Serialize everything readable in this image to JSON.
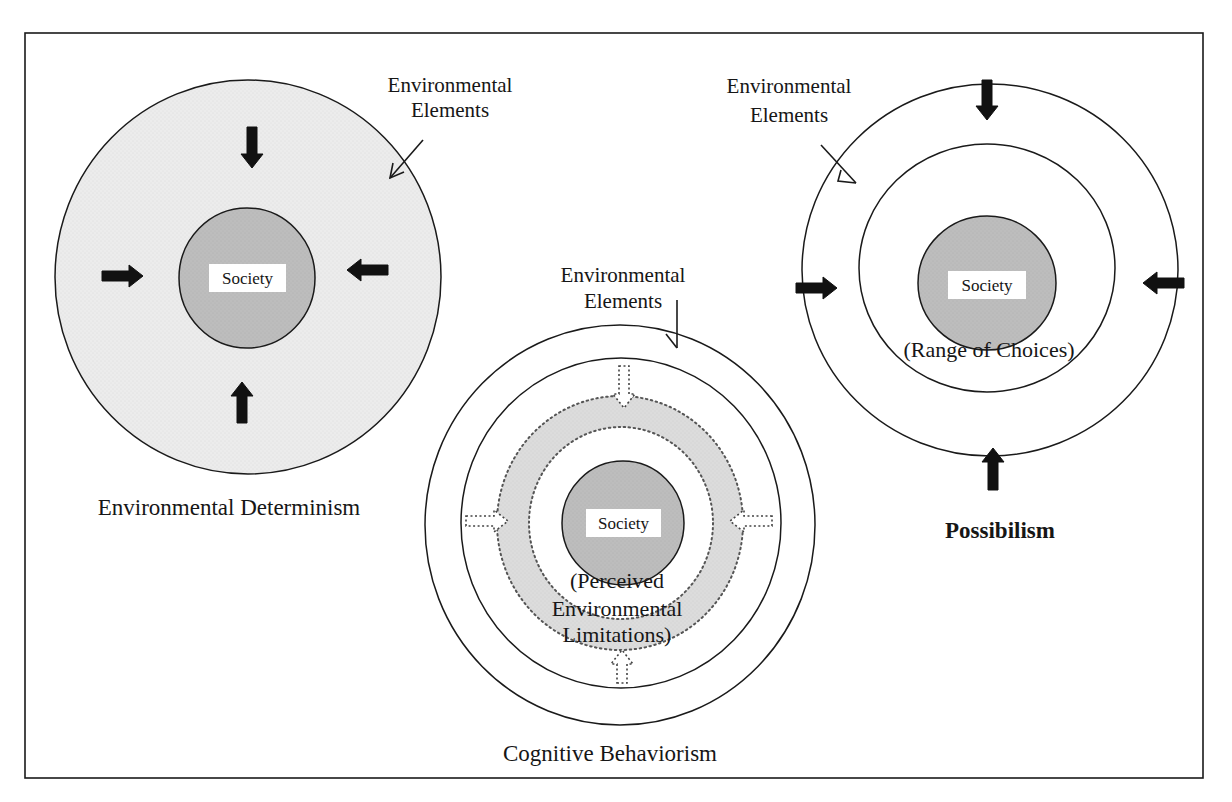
{
  "figure": {
    "frame": {
      "x": 25,
      "y": 33,
      "width": 1178,
      "height": 745,
      "stroke": "#1a1a1a"
    },
    "colors": {
      "paper": "#ffffff",
      "outer_fill_light": "#ececec",
      "society_fill": "#bdbdbd",
      "ring_fill": "#dcdcdc",
      "stroke": "#1a1a1a",
      "arrow": "#111111",
      "society_label_bg": "#ffffff"
    }
  },
  "diagrams": [
    {
      "id": "environmental-determinism",
      "title": "Environmental Determinism",
      "title_pos": {
        "x": 229,
        "y": 515
      },
      "society_label": "Society",
      "pointer_label": [
        "Environmental",
        "Elements"
      ],
      "pointer_label_pos": {
        "x": 450,
        "y1": 92,
        "y2": 117
      },
      "pointer": {
        "x1": 423,
        "y1": 140,
        "x2": 390,
        "y2": 178,
        "tip": [
          [
            390,
            178
          ],
          [
            393,
            163
          ],
          [
            390,
            178
          ],
          [
            404,
            172
          ]
        ]
      },
      "circles": [
        {
          "role": "environment",
          "cx": 248,
          "cy": 277,
          "rx": 193,
          "ry": 197,
          "fill": "outer_fill_light",
          "dashed": false
        },
        {
          "role": "society",
          "cx": 247,
          "cy": 278,
          "rx": 68,
          "ry": 70,
          "fill": "society_fill",
          "dashed": false
        }
      ],
      "society_box": {
        "x": 209,
        "y": 264,
        "w": 77,
        "h": 28
      },
      "arrows": [
        {
          "dir": "down",
          "x": 252,
          "y": 127,
          "len": 41,
          "style": "solid"
        },
        {
          "dir": "right",
          "x": 102,
          "y": 276,
          "len": 41,
          "style": "solid"
        },
        {
          "dir": "left",
          "x": 388,
          "y": 270,
          "len": 41,
          "style": "solid"
        },
        {
          "dir": "up",
          "x": 242,
          "y": 423,
          "len": 41,
          "style": "solid"
        }
      ]
    },
    {
      "id": "cognitive-behaviorism",
      "title": "Cognitive Behaviorism",
      "title_pos": {
        "x": 610,
        "y": 761
      },
      "society_label": "Society",
      "sub_label": [
        "(Perceived",
        "Environmental",
        "Limitations)"
      ],
      "sub_label_pos": {
        "x": 617,
        "y": [
          588,
          616,
          642
        ]
      },
      "pointer_label": [
        "Environmental",
        "Elements"
      ],
      "pointer_label_pos": {
        "x": 623,
        "y1": 282,
        "y2": 308
      },
      "pointer": {
        "x1": 677,
        "y1": 300,
        "x2": 677,
        "y2": 348,
        "tip": [
          [
            677,
            348
          ],
          [
            666,
            334
          ]
        ]
      },
      "circles": [
        {
          "role": "environment",
          "cx": 620,
          "cy": 525,
          "rx": 195,
          "ry": 200,
          "fill": "paper",
          "dashed": false
        },
        {
          "role": "boundary",
          "cx": 621,
          "cy": 523,
          "rx": 160,
          "ry": 165,
          "fill": "paper",
          "dashed": false
        },
        {
          "role": "perceived-outer",
          "cx": 620,
          "cy": 523,
          "rx": 123,
          "ry": 127,
          "fill": "ring_fill",
          "dashed": true
        },
        {
          "role": "perceived-inner",
          "cx": 621,
          "cy": 523,
          "rx": 92,
          "ry": 96,
          "fill": "paper",
          "dashed": true
        },
        {
          "role": "society",
          "cx": 623,
          "cy": 523,
          "rx": 61,
          "ry": 62,
          "fill": "society_fill",
          "dashed": false
        }
      ],
      "society_box": {
        "x": 586,
        "y": 509,
        "w": 75,
        "h": 28
      },
      "arrows": [
        {
          "dir": "down",
          "x": 624,
          "y": 366,
          "len": 42,
          "style": "dashed"
        },
        {
          "dir": "right",
          "x": 466,
          "y": 521,
          "len": 42,
          "style": "dashed"
        },
        {
          "dir": "left",
          "x": 772,
          "y": 521,
          "len": 42,
          "style": "dashed"
        },
        {
          "dir": "up",
          "x": 622,
          "y": 683,
          "len": 33,
          "style": "dashed"
        }
      ]
    },
    {
      "id": "possibilism",
      "title": "Possibilism",
      "title_pos": {
        "x": 1000,
        "y": 538
      },
      "society_label": "Society",
      "sub_label": [
        "(Range of Choices)"
      ],
      "sub_label_pos": {
        "x": 989,
        "y": [
          357
        ]
      },
      "pointer_label": [
        "Environmental",
        "Elements"
      ],
      "pointer_label_pos": {
        "x": 789,
        "y1": 93,
        "y2": 122
      },
      "pointer": {
        "x1": 821,
        "y1": 145,
        "x2": 856,
        "y2": 183,
        "tip": [
          [
            856,
            183
          ],
          [
            838,
            181
          ],
          [
            841,
            170
          ]
        ]
      },
      "circles": [
        {
          "role": "environment",
          "cx": 990,
          "cy": 270,
          "rx": 188,
          "ry": 186,
          "fill": "paper",
          "dashed": false
        },
        {
          "role": "range-of-choices",
          "cx": 987,
          "cy": 268,
          "rx": 128,
          "ry": 124,
          "fill": "paper",
          "dashed": false
        },
        {
          "role": "society",
          "cx": 987,
          "cy": 283,
          "rx": 69,
          "ry": 67,
          "fill": "society_fill",
          "dashed": false
        }
      ],
      "society_box": {
        "x": 948,
        "y": 271,
        "w": 78,
        "h": 28
      },
      "arrows": [
        {
          "dir": "down",
          "x": 987,
          "y": 80,
          "len": 40,
          "style": "solid"
        },
        {
          "dir": "right",
          "x": 796,
          "y": 288,
          "len": 41,
          "style": "solid"
        },
        {
          "dir": "left",
          "x": 1184,
          "y": 283,
          "len": 41,
          "style": "solid"
        },
        {
          "dir": "up",
          "x": 993,
          "y": 490,
          "len": 42,
          "style": "solid"
        }
      ]
    }
  ]
}
